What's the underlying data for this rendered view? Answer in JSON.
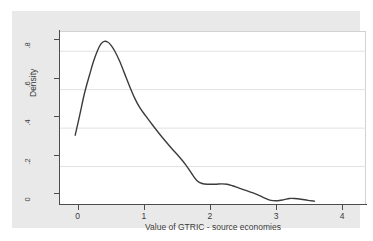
{
  "chart_data": {
    "type": "line",
    "title": "",
    "subtitle": "",
    "xlabel": "Value of GTRIC - source economies",
    "ylabel": "Density",
    "xlim": [
      -0.45,
      4.18
    ],
    "ylim": [
      0,
      0.9
    ],
    "xticks": [
      "0",
      "1",
      "2",
      "3",
      "4"
    ],
    "xtick_values": [
      0,
      1,
      2,
      3,
      4
    ],
    "yticks": [
      "0",
      ".2",
      ".4",
      ".6",
      ".8"
    ],
    "ytick_values": [
      0,
      0.2,
      0.4,
      0.6,
      0.8
    ],
    "grid": "horizontal",
    "legend": null,
    "series": [
      {
        "name": "Kernel density of GTRIC - source economies",
        "color": "#3c3c3c",
        "x": [
          -0.22,
          -0.15,
          -0.08,
          0.0,
          0.06,
          0.12,
          0.17,
          0.22,
          0.27,
          0.32,
          0.38,
          0.45,
          0.52,
          0.6,
          0.68,
          0.76,
          0.85,
          0.95,
          1.05,
          1.15,
          1.25,
          1.35,
          1.45,
          1.55,
          1.62,
          1.7,
          1.8,
          1.9,
          2.0,
          2.08,
          2.16,
          2.26,
          2.36,
          2.46,
          2.56,
          2.66,
          2.74,
          2.84,
          2.94,
          3.02,
          3.1,
          3.2,
          3.3,
          3.4
        ],
        "y": [
          0.363,
          0.47,
          0.58,
          0.68,
          0.75,
          0.805,
          0.838,
          0.851,
          0.848,
          0.832,
          0.8,
          0.75,
          0.69,
          0.62,
          0.556,
          0.505,
          0.462,
          0.416,
          0.372,
          0.33,
          0.29,
          0.252,
          0.21,
          0.16,
          0.128,
          0.112,
          0.108,
          0.108,
          0.11,
          0.108,
          0.1,
          0.088,
          0.076,
          0.064,
          0.05,
          0.034,
          0.024,
          0.022,
          0.028,
          0.034,
          0.034,
          0.03,
          0.024,
          0.02
        ]
      }
    ],
    "annotations": []
  }
}
